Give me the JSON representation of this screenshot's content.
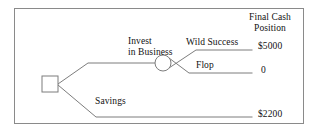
{
  "diagram": {
    "type": "decision-tree",
    "title_block": {
      "line1": "Final Cash",
      "line2": "Position"
    },
    "nodes": [
      {
        "id": "decision",
        "shape": "square",
        "name": "decision-node"
      },
      {
        "id": "chance",
        "shape": "circle",
        "name": "chance-node"
      }
    ],
    "branches": [
      {
        "id": "invest",
        "label_line1": "Invest",
        "label_line2": "in Business"
      },
      {
        "id": "savings",
        "label": "Savings"
      },
      {
        "id": "wild-success",
        "label": "Wild Success"
      },
      {
        "id": "flop",
        "label": "Flop"
      }
    ],
    "outcomes": [
      {
        "id": "wild-success-payoff",
        "value": "$5000"
      },
      {
        "id": "flop-payoff",
        "value": "0"
      },
      {
        "id": "savings-payoff",
        "value": "$2200"
      }
    ],
    "colors": {
      "line": "#7d7d7d",
      "text": "#111111",
      "frame": "#8a8a8a",
      "background": "#ffffff"
    }
  }
}
